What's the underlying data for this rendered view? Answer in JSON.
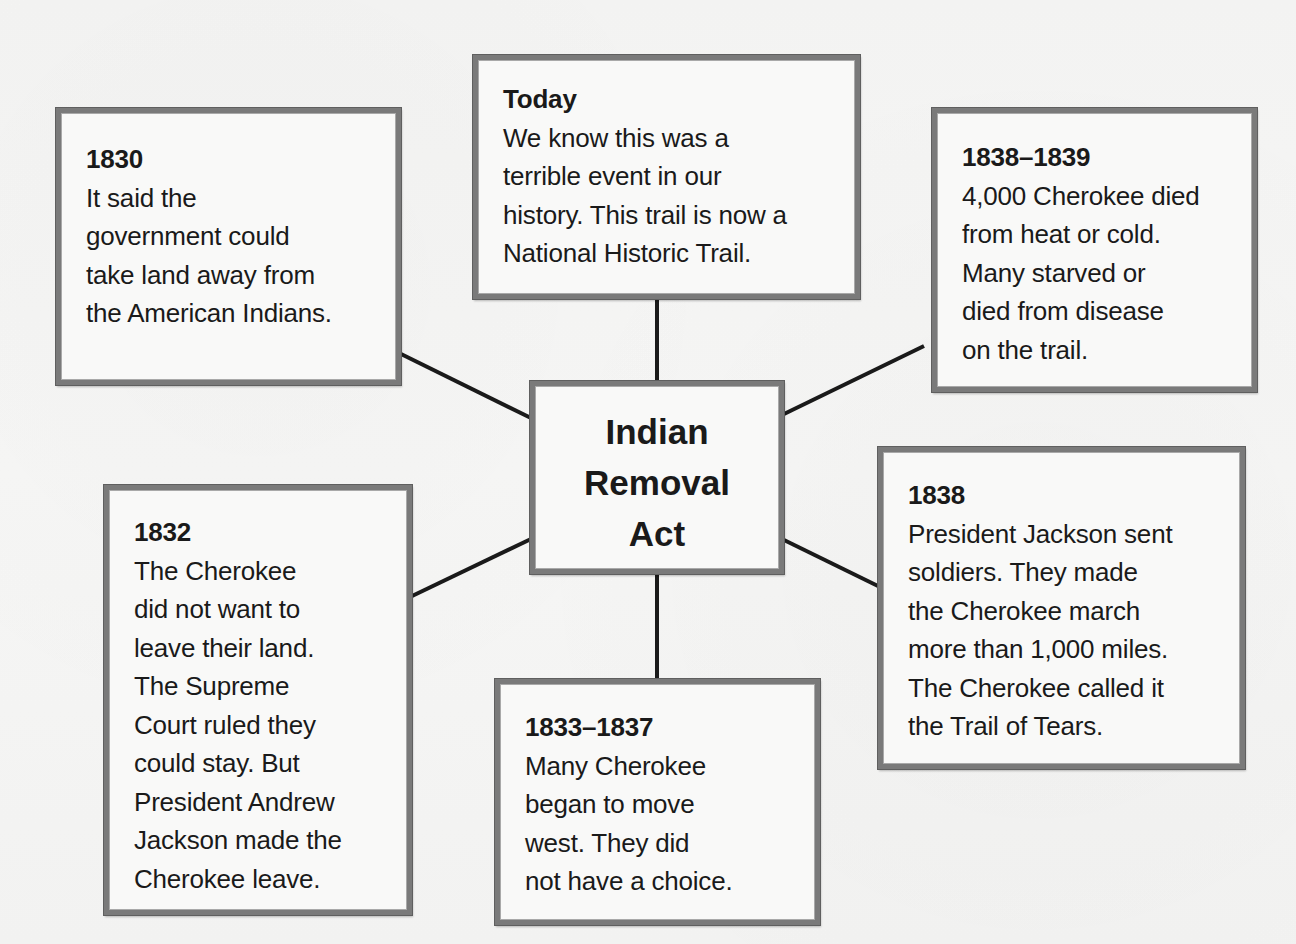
{
  "diagram": {
    "type": "concept-web",
    "center": {
      "title_lines": [
        "Indian",
        "Removal",
        "Act"
      ]
    },
    "boxes": [
      {
        "id": "1830",
        "year": "1830",
        "lines": [
          "It said the",
          "government could",
          "take land away from",
          "the American Indians."
        ]
      },
      {
        "id": "today",
        "year": "Today",
        "lines": [
          "We know this was a",
          "terrible event in our",
          "history.  This trail is now a",
          "National Historic Trail."
        ]
      },
      {
        "id": "1838-1839",
        "year": "1838–1839",
        "lines": [
          "4,000 Cherokee died",
          "from heat or cold.",
          "Many starved or",
          "died from disease",
          "on the trail."
        ]
      },
      {
        "id": "1832",
        "year": "1832",
        "lines": [
          "The Cherokee",
          "did not want to",
          "leave their land.",
          "The Supreme",
          "Court ruled they",
          "could stay.  But",
          "President Andrew",
          "Jackson made the",
          "Cherokee leave."
        ]
      },
      {
        "id": "1833-1837",
        "year": "1833–1837",
        "lines": [
          "Many Cherokee",
          "began to move",
          "west.  They did",
          "not have a choice."
        ]
      },
      {
        "id": "1838",
        "year": "1838",
        "lines": [
          "President Jackson sent",
          "soldiers.  They made",
          "the Cherokee march",
          "more than 1,000 miles.",
          "The Cherokee called it",
          "the Trail of Tears."
        ]
      }
    ],
    "colors": {
      "border": "#7a7a7a",
      "line": "#1a1a1a",
      "box_fill": "#f9f9f8",
      "background": "#f5f5f4"
    }
  }
}
